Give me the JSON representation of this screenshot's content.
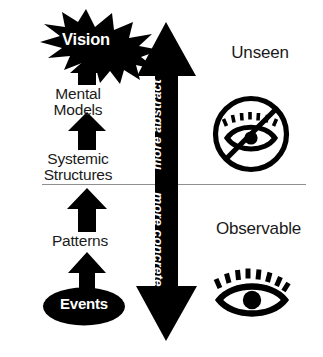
{
  "diagram": {
    "background_color": "#ffffff",
    "ink_color": "#000000",
    "divider_color": "#8a8a8a"
  },
  "ladder": {
    "levels": [
      {
        "id": "vision",
        "label": "Vision",
        "style": "starburst-reversed"
      },
      {
        "id": "mental-models",
        "label": "Mental\nModels",
        "style": "plain"
      },
      {
        "id": "systemic-structures",
        "label": "Systemic\nStructures",
        "style": "plain"
      },
      {
        "id": "patterns",
        "label": "Patterns",
        "style": "plain"
      },
      {
        "id": "events",
        "label": "Events",
        "style": "ellipse-reversed"
      }
    ]
  },
  "axis": {
    "top_label": "more abstract",
    "bottom_label": "more concrete",
    "direction": "double-headed-vertical"
  },
  "zones": {
    "above": {
      "label": "Unseen",
      "icon": "eye-slash-icon"
    },
    "below": {
      "label": "Observable",
      "icon": "eye-icon"
    }
  }
}
